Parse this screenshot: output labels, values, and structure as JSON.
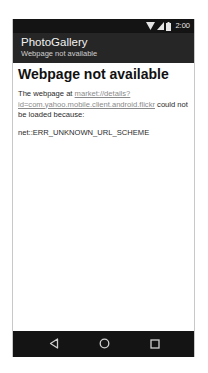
{
  "status_bar": {
    "time": "2:00",
    "icons": [
      "wifi-icon",
      "signal-icon",
      "battery-icon"
    ]
  },
  "app_bar": {
    "title": "PhotoGallery",
    "subtitle": "Webpage not available"
  },
  "content": {
    "heading": "Webpage not available",
    "body_prefix": "The webpage at ",
    "link_text": "market://details?id=com.yahoo.mobile.client.android.flickr",
    "body_suffix": " could not be loaded because:",
    "error_code": "net::ERR_UNKNOWN_URL_SCHEME"
  },
  "nav_bar": {
    "buttons": [
      "back",
      "home",
      "recents"
    ]
  },
  "colors": {
    "status_bar_bg": "#141414",
    "app_bar_bg": "#262626",
    "nav_bar_bg": "#141414",
    "link": "#8a8a8a"
  }
}
